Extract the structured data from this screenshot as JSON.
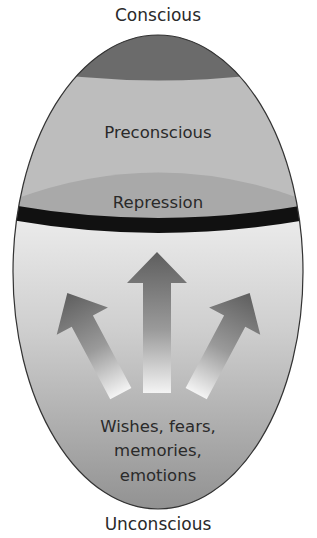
{
  "title": "Conscious",
  "regions": {
    "conscious": {
      "label": "Conscious",
      "color": "#6b6b6b"
    },
    "preconscious": {
      "label": "Preconscious",
      "color": "#bdbdbd"
    },
    "repression": {
      "label": "Repression",
      "color": "#a9a9a9",
      "barrier_color": "#111111"
    },
    "unconscious": {
      "label": "Unconscious",
      "contents": [
        "Wishes, fears,",
        "memories,",
        "emotions"
      ],
      "gradient_top": "#ececec",
      "gradient_bottom": "#888888"
    }
  },
  "arrows": [
    {
      "name": "left-arrow",
      "direction": "up-left"
    },
    {
      "name": "center-arrow",
      "direction": "up"
    },
    {
      "name": "right-arrow",
      "direction": "up-right"
    }
  ]
}
